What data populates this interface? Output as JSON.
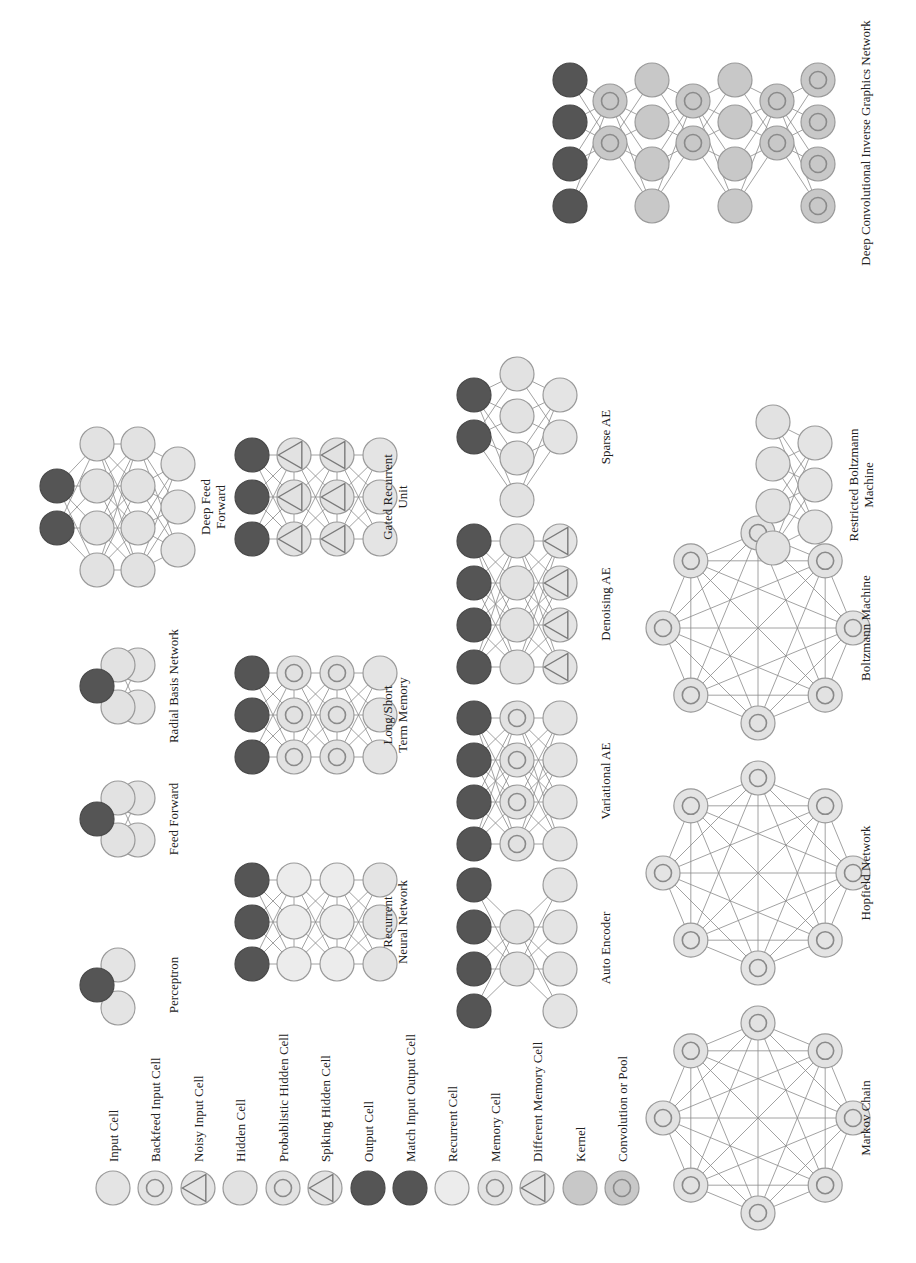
{
  "colors": {
    "input": "#e4e4e4",
    "hidden": "#e2e2e2",
    "output": "#555555",
    "kernel": "#c8c8c8",
    "stroke": "#9a9a9a",
    "edge": "#8a8a8a"
  },
  "legend": [
    {
      "label": "Input Cell",
      "type": "input"
    },
    {
      "label": "Backfeed Input Cell",
      "type": "backfeed"
    },
    {
      "label": "Noisy Input Cell",
      "type": "noisy"
    },
    {
      "label": "Hidden Cell",
      "type": "hidden"
    },
    {
      "label": "Probablistic Hidden Cell",
      "type": "prob"
    },
    {
      "label": "Spiking Hidden Cell",
      "type": "spiking"
    },
    {
      "label": "Output Cell",
      "type": "output"
    },
    {
      "label": "Match Input Output Cell",
      "type": "match"
    },
    {
      "label": "Recurrent Cell",
      "type": "recurrent"
    },
    {
      "label": "Memory Cell",
      "type": "memory"
    },
    {
      "label": "Different Memory Cell",
      "type": "diffmem"
    },
    {
      "label": "Kernel",
      "type": "kernel"
    },
    {
      "label": "Convolution or Pool",
      "type": "conv"
    }
  ],
  "networks": [
    {
      "name": "Perceptron",
      "label": [
        "Perceptron"
      ]
    },
    {
      "name": "Feed Forward",
      "label": [
        "Feed Forward"
      ]
    },
    {
      "name": "Radial Basis Network",
      "label": [
        "Radial Basis Network"
      ]
    },
    {
      "name": "Deep Feed Forward",
      "label": [
        "Deep Feed",
        "Forward"
      ]
    },
    {
      "name": "Recurrent Neural Network",
      "label": [
        "Recurrent",
        "Neural Network"
      ]
    },
    {
      "name": "Long/Short Term Memory",
      "label": [
        "Long/Short",
        "Term Memory"
      ]
    },
    {
      "name": "Gated Recurrent Unit",
      "label": [
        "Gated Recurrent",
        "Unit"
      ]
    },
    {
      "name": "Auto Encoder",
      "label": [
        "Auto Encoder"
      ]
    },
    {
      "name": "Variational AE",
      "label": [
        "Variational AE"
      ]
    },
    {
      "name": "Denoising AE",
      "label": [
        "Denoising AE"
      ]
    },
    {
      "name": "Sparse AE",
      "label": [
        "Sparse AE"
      ]
    },
    {
      "name": "Markov Chain",
      "label": [
        "Markov Chain"
      ]
    },
    {
      "name": "Hopfield Network",
      "label": [
        "Hopfield Network"
      ]
    },
    {
      "name": "Boltzmann Machine",
      "label": [
        "Boltzmann Machine"
      ]
    },
    {
      "name": "Restricted Boltzmann Machine",
      "label": [
        "Restricted Boltzmann",
        "Machine"
      ]
    },
    {
      "name": "Deep Convolutional Inverse Graphics Network",
      "label": [
        "Deep Convolutional Inverse Graphics Network"
      ]
    }
  ]
}
